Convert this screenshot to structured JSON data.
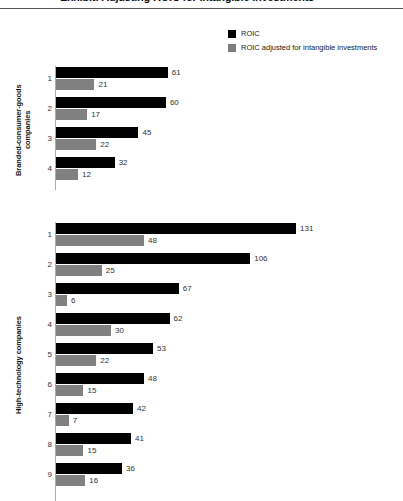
{
  "title": "Exhibit: Adjusting ROIC for intangible investments",
  "legend": {
    "position": "top-right",
    "items": [
      {
        "label": "ROIC",
        "color": "#000000",
        "swatch_name": "legend-swatch-roic"
      },
      {
        "label": "ROIC adjusted for intangible investments",
        "color": "#808080",
        "swatch_name": "legend-swatch-roic-adjusted"
      }
    ]
  },
  "colors": {
    "roic": "#000000",
    "roic_adjusted": "#808080",
    "axis": "#aaaaaa",
    "rule": "#555555",
    "text": "#1a1a1a"
  },
  "chart_data": {
    "type": "bar",
    "orientation": "horizontal",
    "title": "Exhibit: Adjusting ROIC for intangible investments",
    "xlabel": "",
    "ylabel": "",
    "xlim": [
      0,
      131
    ],
    "grid": false,
    "legend_position": "top-right",
    "series": [
      {
        "name": "ROIC",
        "color": "#000000"
      },
      {
        "name": "ROIC adjusted for intangible investments",
        "color": "#808080"
      }
    ],
    "panels": [
      {
        "label": "Branded-consumer-goods companies",
        "categories": [
          "1",
          "2",
          "3",
          "4"
        ],
        "values": {
          "ROIC": [
            61,
            60,
            45,
            32
          ],
          "ROIC adjusted for intangible investments": [
            21,
            17,
            22,
            12
          ]
        }
      },
      {
        "label": "High-technology companies",
        "categories": [
          "1",
          "2",
          "3",
          "4",
          "5",
          "6",
          "7",
          "8",
          "9"
        ],
        "values": {
          "ROIC": [
            131,
            106,
            67,
            62,
            53,
            48,
            42,
            41,
            36
          ],
          "ROIC adjusted for intangible investments": [
            48,
            25,
            6,
            30,
            22,
            15,
            7,
            15,
            16
          ]
        }
      }
    ]
  }
}
